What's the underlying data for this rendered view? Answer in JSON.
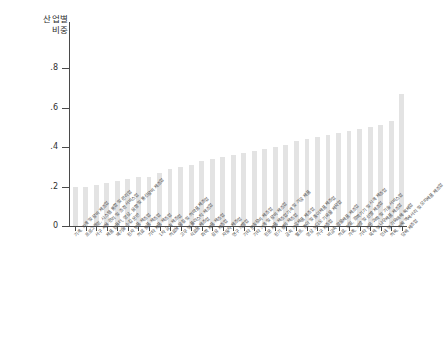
{
  "chart": {
    "type": "bar",
    "y_axis_title_line1": "산업별",
    "y_axis_title_line2": "비중",
    "y_ticks": [
      "0",
      ".2",
      ".4",
      ".6",
      ".8"
    ],
    "bar_color": "#e3e3e3",
    "axis_color": "#4a4a4a"
  },
  "chart_data": {
    "type": "bar",
    "title": "",
    "subtitle": "",
    "xlabel": "",
    "ylabel": "산업별 비중",
    "ylim": [
      0,
      0.8
    ],
    "yticks": [
      0,
      0.2,
      0.4,
      0.6,
      0.8
    ],
    "ytick_labels": [
      "0",
      ".2",
      ".4",
      ".6",
      ".8"
    ],
    "grid": false,
    "legend": "none",
    "bar_color": "#e3e3e3",
    "sorted": "ascending",
    "categories": [
      "기계, 기계 및 장비 제조업",
      "프로그래밍, 시스템 통합 및 관리업",
      "서구 사용 관리 및 조경 서비스업",
      "제품 컴퓨터, 영상, 음향 및 통신장비 제조업",
      "폐기물 수집 운반",
      "전자 부품 제조업",
      "의료 용품 제조업",
      "기타 제품 제조업",
      "1차 금속 제조업",
      "의료용 물질 및 의약품 제조업",
      "고무 및 플라스틱 제조업",
      "식료품 제조업",
      "화학 제품 제조업",
      "섬유 제조업",
      "자동차 제조업",
      "연구 개발업",
      "기타 운송장비 제조업",
      "기타 기계 및 장비 제조업",
      "전문 제품 제조업기계 및 가공 제품",
      "전기 장비 제조업",
      "금속 가공제품 제조업",
      "펄프, 종이 및 종이제품 제조업",
      "영상 오디오 기록물 제작업",
      "가구 제조업",
      "비금속 광물제품 제조업",
      "의료, 정밀, 광학기기 및 시계 제조업",
      "가죽, 가방 및 신발 제조업",
      "기타 전문 과학 및 기술 서비스업",
      "목재 및 나무제품 제조업",
      "인쇄 및 기록매체 복제업",
      "의복, 의복 액세서리 및 모피제품 제조업",
      "담배 제조업"
    ],
    "values": [
      0.2,
      0.2,
      0.21,
      0.22,
      0.23,
      0.24,
      0.25,
      0.25,
      0.27,
      0.29,
      0.3,
      0.31,
      0.33,
      0.34,
      0.35,
      0.36,
      0.37,
      0.38,
      0.39,
      0.4,
      0.41,
      0.43,
      0.44,
      0.45,
      0.46,
      0.47,
      0.48,
      0.49,
      0.5,
      0.51,
      0.53,
      0.67
    ]
  }
}
